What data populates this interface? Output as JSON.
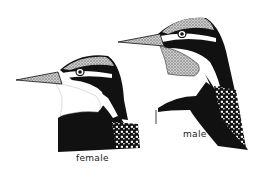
{
  "figure": {
    "labels": {
      "female": "female",
      "male": "male"
    },
    "colors": {
      "ink": "#111111",
      "background": "#ffffff",
      "stipple": "#9a9a9a"
    }
  }
}
